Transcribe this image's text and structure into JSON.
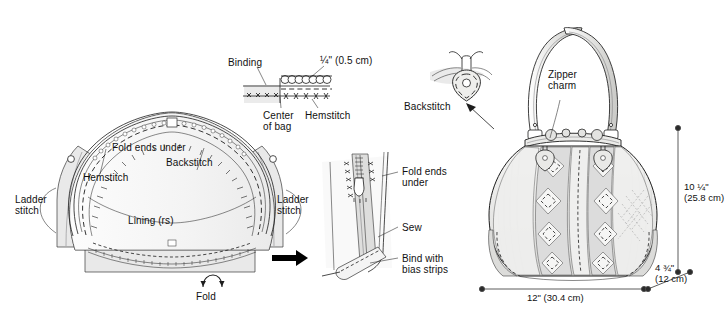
{
  "document": {
    "title": "Bag assembly instruction diagram",
    "background_color": "#ffffff",
    "ink_color": "#1a1a1a"
  },
  "figures": {
    "left": {
      "name": "Lining and frame assembly",
      "labels": {
        "fold_ends_under": "Fold ends under",
        "backstitch": "Backstitch",
        "hemstitch": "Hemstitch",
        "ladder_stitch_left": "Ladder\nstitch",
        "ladder_stitch_right": "Ladder\nstitch",
        "lining_rs": "Lining (rs)",
        "fold": "Fold"
      },
      "icons": {
        "fold_arrow": "curved-up-arrow-icon",
        "step_arrow": "right-arrow-icon"
      }
    },
    "binding_detail": {
      "name": "Binding and hemstitch detail",
      "labels": {
        "binding": "Binding",
        "measurement": "¼\" (0.5 cm)",
        "center_of_bag": "Center\nof bag",
        "hemstitch": "Hemstitch"
      }
    },
    "zipper_detail": {
      "name": "Zipper end finishing detail",
      "labels": {
        "fold_ends_under": "Fold ends\nunder",
        "sew": "Sew",
        "bind_with_bias_strips": "Bind with\nbias strips"
      }
    },
    "right": {
      "name": "Finished bag illustration",
      "labels": {
        "backstitch": "Backstitch",
        "zipper_charm": "Zipper\ncharm"
      },
      "icons": {
        "callout_arrow": "up-left-arrow-icon"
      },
      "dimensions": {
        "height": "10 ¼\"\n(25.8 cm)",
        "width": "12\" (30.4 cm)",
        "depth": "4 ¾\"\n(12 cm)"
      }
    }
  }
}
